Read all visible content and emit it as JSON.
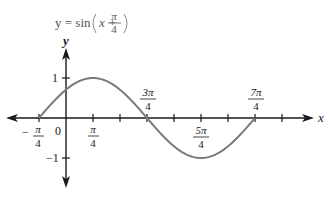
{
  "chart_data": {
    "type": "line",
    "function": "sin(x + pi/4)",
    "xlabel": "x",
    "ylabel": "y",
    "x_domain": [
      -0.7854,
      5.4978
    ],
    "x_domain_label": [
      "-π/4",
      "7π/4"
    ],
    "ylim": [
      -1,
      1
    ],
    "grid": false,
    "legend": null,
    "x_ticks": [
      {
        "value": -0.7854,
        "label": "-π/4"
      },
      {
        "value": 0,
        "label": "0"
      },
      {
        "value": 0.7854,
        "label": "π/4"
      },
      {
        "value": 1.5708,
        "label": ""
      },
      {
        "value": 2.3562,
        "label": "3π/4"
      },
      {
        "value": 3.1416,
        "label": ""
      },
      {
        "value": 3.927,
        "label": "5π/4"
      },
      {
        "value": 4.7124,
        "label": ""
      },
      {
        "value": 5.4978,
        "label": "7π/4"
      },
      {
        "value": 6.2832,
        "label": ""
      }
    ],
    "y_ticks": [
      {
        "value": 1,
        "label": "1"
      },
      {
        "value": -1,
        "label": "-1"
      }
    ],
    "key_points": [
      {
        "x": "-π/4",
        "y": 0
      },
      {
        "x": "0",
        "y": 0.707
      },
      {
        "x": "π/4",
        "y": 1
      },
      {
        "x": "3π/4",
        "y": 0
      },
      {
        "x": "5π/4",
        "y": -1
      },
      {
        "x": "7π/4",
        "y": 0
      }
    ],
    "colors": {
      "axes": "#1a1a1a",
      "curve": "#7a7a7a",
      "text": "#1a1a1a"
    }
  },
  "title": {
    "lhs": "y = sin",
    "arg_left": "x +",
    "frac_num": "π",
    "frac_den": "4"
  },
  "axes": {
    "x_label": "x",
    "y_label": "y"
  },
  "labels": {
    "zero": "0",
    "neg_pi_4": {
      "sign": "−",
      "num": "π",
      "den": "4"
    },
    "pi_4": {
      "num": "π",
      "den": "4"
    },
    "three_pi_4": {
      "num": "3π",
      "den": "4"
    },
    "five_pi_4": {
      "num": "5π",
      "den": "4"
    },
    "seven_pi_4": {
      "num": "7π",
      "den": "4"
    },
    "y_one": "1",
    "y_neg_one": "−1"
  }
}
